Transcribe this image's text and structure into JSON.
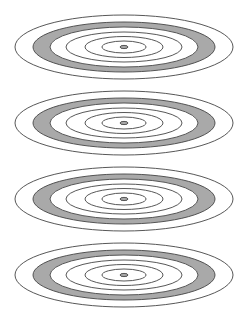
{
  "figure": {
    "width": 247,
    "height": 317,
    "background": "#ffffff",
    "stroke_color": "#444444",
    "stroke_width": 0.9,
    "band_fill": "#a9a9a9",
    "center_x": 124,
    "groups": [
      {
        "id": "group-1",
        "cy": 47
      },
      {
        "id": "group-2",
        "cy": 123
      },
      {
        "id": "group-3",
        "cy": 199
      },
      {
        "id": "group-4",
        "cy": 275
      }
    ],
    "rings": [
      {
        "name": "outer-ring",
        "rx": 109,
        "ry": 32,
        "fill": "none"
      },
      {
        "name": "band-outer-edge",
        "rx": 91,
        "ry": 25,
        "fill": "band"
      },
      {
        "name": "band-inner-edge",
        "rx": 74,
        "ry": 20,
        "fill": "white"
      },
      {
        "name": "ring-3",
        "rx": 58,
        "ry": 15,
        "fill": "none"
      },
      {
        "name": "ring-4",
        "rx": 39,
        "ry": 10.5,
        "fill": "none"
      },
      {
        "name": "ring-5",
        "rx": 22,
        "ry": 6,
        "fill": "none"
      },
      {
        "name": "center-dot",
        "rx": 4,
        "ry": 1.6,
        "fill": "band"
      }
    ]
  }
}
